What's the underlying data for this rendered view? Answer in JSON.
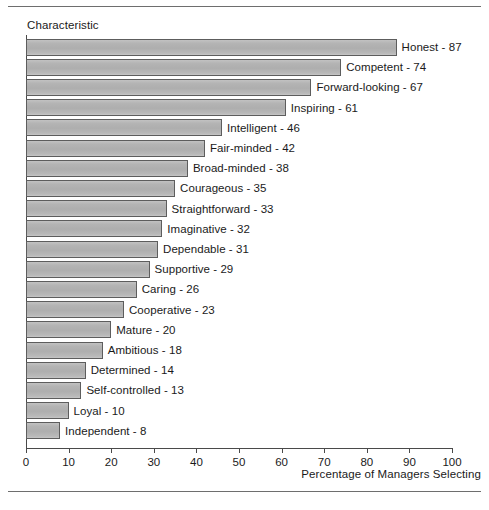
{
  "figure": {
    "y_axis_header": "Characteristic",
    "x_axis_title": "Percentage of Managers Selecting"
  },
  "colors": {
    "bar_fill": "#b4b4b4",
    "bar_border": "#5d5d5d",
    "axis": "#4a4a4a",
    "rule": "#6e6e6e",
    "text": "#1a1a1a",
    "background": "#ffffff"
  },
  "chart_data": {
    "type": "bar",
    "orientation": "horizontal",
    "title": "",
    "subtitle": "",
    "xlabel": "Percentage of Managers Selecting",
    "ylabel": "Characteristic",
    "xlim": [
      0,
      100
    ],
    "xticks": [
      0,
      10,
      20,
      30,
      40,
      50,
      60,
      70,
      80,
      90,
      100
    ],
    "grid": false,
    "legend": "none",
    "label_format": "{category} - {value}",
    "categories": [
      "Honest",
      "Competent",
      "Forward-looking",
      "Inspiring",
      "Intelligent",
      "Fair-minded",
      "Broad-minded",
      "Courageous",
      "Straightforward",
      "Imaginative",
      "Dependable",
      "Supportive",
      "Caring",
      "Cooperative",
      "Mature",
      "Ambitious",
      "Determined",
      "Self-controlled",
      "Loyal",
      "Independent"
    ],
    "values": [
      87,
      74,
      67,
      61,
      46,
      42,
      38,
      35,
      33,
      32,
      31,
      29,
      26,
      23,
      20,
      18,
      14,
      13,
      10,
      8
    ],
    "point_labels": [
      "Honest - 87",
      "Competent - 74",
      "Forward-looking - 67",
      "Inspiring - 61",
      "Intelligent - 46",
      "Fair-minded - 42",
      "Broad-minded - 38",
      "Courageous - 35",
      "Straightforward - 33",
      "Imaginative - 32",
      "Dependable - 31",
      "Supportive - 29",
      "Caring - 26",
      "Cooperative - 23",
      "Mature - 20",
      "Ambitious - 18",
      "Determined - 14",
      "Self-controlled - 13",
      "Loyal - 10",
      "Independent - 8"
    ]
  }
}
